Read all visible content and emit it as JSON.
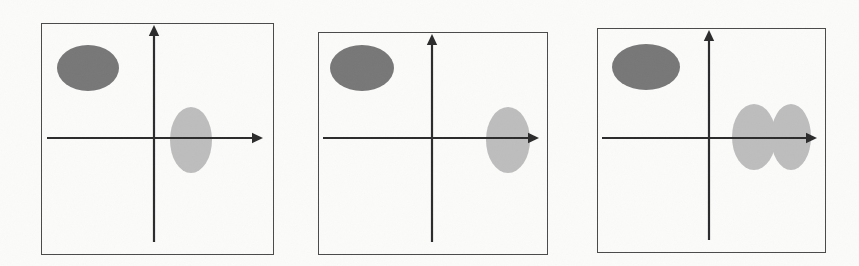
{
  "figure": {
    "title": "",
    "background_color": "#fbfbfa",
    "width": 859,
    "height": 266,
    "panel_count": 3,
    "frame_color": "#4a4a4a",
    "axis_color": "#2b2b2b",
    "dark_blob_color": "#777777",
    "light_blob_color": "#bdbdbd"
  },
  "panels": [
    {
      "id": "panel-1",
      "label": "",
      "x": 41,
      "y": 23,
      "width": 233,
      "height": 232,
      "origin": {
        "x": 113,
        "y": 115
      },
      "x_axis": {
        "start_x": 6,
        "end_x": 222,
        "y": 115,
        "arrow": "right"
      },
      "y_axis": {
        "x": 113,
        "start_y": 219,
        "end_y": 2,
        "arrow": "up"
      },
      "blobs": [
        {
          "name": "dark-blob",
          "shade": "dark",
          "cx": 47,
          "cy": 45,
          "rx": 31,
          "ry": 23,
          "color": "#777777"
        },
        {
          "name": "light-blob",
          "shade": "light",
          "cx": 150,
          "cy": 117,
          "rx": 21,
          "ry": 33,
          "color": "#bdbdbd"
        }
      ]
    },
    {
      "id": "panel-2",
      "label": "",
      "x": 318,
      "y": 32,
      "width": 230,
      "height": 223,
      "origin": {
        "x": 114,
        "y": 106
      },
      "x_axis": {
        "start_x": 5,
        "end_x": 221,
        "y": 106,
        "arrow": "right"
      },
      "y_axis": {
        "x": 114,
        "start_y": 210,
        "end_y": 2,
        "arrow": "up"
      },
      "blobs": [
        {
          "name": "dark-blob",
          "shade": "dark",
          "cx": 44,
          "cy": 36,
          "rx": 32,
          "ry": 23,
          "color": "#777777"
        },
        {
          "name": "light-blob",
          "shade": "light",
          "cx": 190,
          "cy": 108,
          "rx": 22,
          "ry": 33,
          "color": "#bdbdbd"
        }
      ]
    },
    {
      "id": "panel-3",
      "label": "",
      "x": 597,
      "y": 28,
      "width": 229,
      "height": 225,
      "origin": {
        "x": 112,
        "y": 110
      },
      "x_axis": {
        "start_x": 5,
        "end_x": 220,
        "y": 110,
        "arrow": "right"
      },
      "y_axis": {
        "x": 112,
        "start_y": 212,
        "end_y": 2,
        "arrow": "up"
      },
      "blobs": [
        {
          "name": "dark-blob",
          "shade": "dark",
          "cx": 49,
          "cy": 39,
          "rx": 34,
          "ry": 23,
          "color": "#777777"
        },
        {
          "name": "light-blob-left",
          "shade": "light",
          "cx": 157,
          "cy": 109,
          "rx": 22,
          "ry": 33,
          "color": "#bdbdbd"
        },
        {
          "name": "light-blob-right",
          "shade": "light",
          "cx": 194,
          "cy": 109,
          "rx": 20,
          "ry": 33,
          "color": "#bdbdbd"
        }
      ]
    }
  ]
}
